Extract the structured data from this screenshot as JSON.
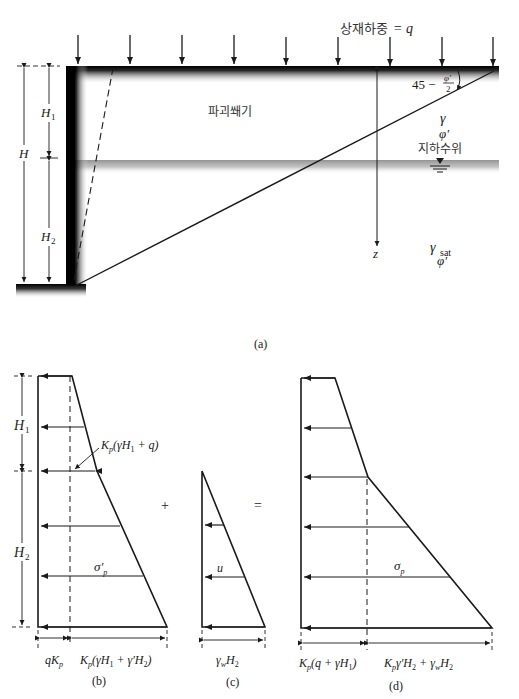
{
  "figure_a": {
    "caption": "(a)",
    "surcharge_label": "상재하중",
    "surcharge_eq": "= q",
    "failure_wedge_label": "파괴쐐기",
    "angle_label_prefix": "45 −",
    "angle_frac_num": "φ′",
    "angle_frac_den": "2",
    "upper_soil": {
      "gamma": "γ",
      "phi": "φ′"
    },
    "water_table_label": "지하수위",
    "lower_soil": {
      "gamma": "γ",
      "gamma_sub": "sat",
      "phi": "φ′"
    },
    "depth_axis": "z",
    "dims": {
      "H": "H",
      "H1": "H",
      "H1_sub": "1",
      "H2": "H",
      "H2_sub": "2"
    }
  },
  "figure_b": {
    "caption": "(b)",
    "label_H1": "H",
    "label_H1_sub": "1",
    "label_H2": "H",
    "label_H2_sub": "2",
    "annotation": "K",
    "annotation_sub": "p",
    "annotation_rest": "(γH",
    "annotation_rest_sub": "1",
    "annotation_end": " + q)",
    "stress_label": "σ′",
    "stress_sub": "p",
    "bottom_left": "qK",
    "bottom_left_sub": "p",
    "bottom_right": "K",
    "bottom_right_sub": "p",
    "bottom_right_rest": "(γH",
    "bottom_right_rest_sub1": "1",
    "bottom_right_mid": " + γ′H",
    "bottom_right_sub2": "2",
    "bottom_right_end": ")"
  },
  "operators": {
    "plus": "+",
    "equals": "="
  },
  "figure_c": {
    "caption": "(c)",
    "pressure_label": "u",
    "bottom": "γ",
    "bottom_sub": "w",
    "bottom_rest": "H",
    "bottom_rest_sub": "2"
  },
  "figure_d": {
    "caption": "(d)",
    "stress_label": "σ",
    "stress_sub": "p",
    "bottom_left": "K",
    "bottom_left_sub": "p",
    "bottom_left_rest": "(q + γH",
    "bottom_left_rest_sub": "1",
    "bottom_left_end": ")",
    "bottom_right": "K",
    "bottom_right_sub": "p",
    "bottom_right_rest": "γ′H",
    "bottom_right_rest_sub": "2",
    "bottom_right_end": " + γ",
    "bottom_right_end_sub": "w",
    "bottom_right_tail": "H",
    "bottom_right_tail_sub": "2"
  },
  "colors": {
    "ink": "#1a1a1a",
    "wall": "#000000",
    "water_band": "#9a9a9a"
  }
}
